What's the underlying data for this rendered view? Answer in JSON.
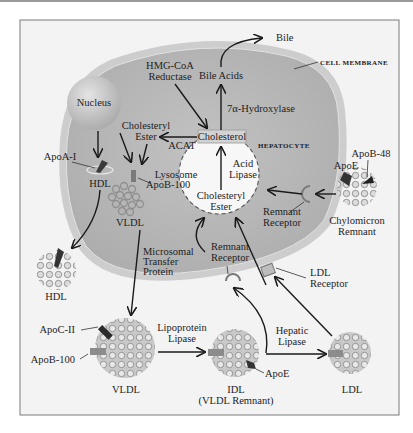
{
  "figure": {
    "frame_color": "#f2f2f2",
    "cell_color": "#b8b8b8",
    "membrane_color": "#cfcfcf"
  },
  "cell": {
    "membrane_label": "CELL MEMBRANE",
    "cell_label": "HEPATOCYTE",
    "nucleus_label": "Nucleus",
    "lysosome_label": "Lysosome"
  },
  "molecules": {
    "bile": "Bile",
    "bile_acids": "Bile Acids",
    "cholesterol": "Cholesterol",
    "cholesteryl_ester_top_line1": "Cholesteryl",
    "cholesteryl_ester_top_line2": "Ester",
    "cholesteryl_ester_lys_line1": "Cholesteryl",
    "cholesteryl_ester_lys_line2": "Ester"
  },
  "enzymes": {
    "hmg_line1": "HMG-CoA",
    "hmg_line2": "Reductase",
    "hydroxylase": "7α-Hydroxylase",
    "acat": "ACAT",
    "acid_lipase_line1": "Acid",
    "acid_lipase_line2": "Lipase",
    "mtp_line1": "Microsomal",
    "mtp_line2": "Transfer",
    "mtp_line3": "Protein",
    "lpl_line1": "Lipoprotein",
    "lpl_line2": "Lipase",
    "hl_line1": "Hepatic",
    "hl_line2": "Lipase"
  },
  "receptors": {
    "remnant_right_line1": "Remnant",
    "remnant_right_line2": "Receptor",
    "remnant_inner_line1": "Remnant",
    "remnant_inner_line2": "Receptor",
    "remnant_bottom_line1": "Remnant",
    "remnant_bottom_line2": "Receptor",
    "ldl_line1": "LDL",
    "ldl_line2": "Receptor"
  },
  "apoproteins": {
    "apoa1": "ApoA-I",
    "apob100_inner": "ApoB-100",
    "apoe_chylo": "ApoE",
    "apob48": "ApoB-48",
    "apoc2": "ApoC-II",
    "apob100_vldl": "ApoB-100",
    "apoe_idl": "ApoE"
  },
  "lipoproteins": {
    "hdl_inner": "HDL",
    "vldl_inner": "VLDL",
    "hdl_outer": "HDL",
    "chylo_line1": "Chylomicron",
    "chylo_line2": "Remnant",
    "vldl_outer": "VLDL",
    "idl_line1": "IDL",
    "idl_line2": "(VLDL Remnant)",
    "ldl": "LDL"
  }
}
